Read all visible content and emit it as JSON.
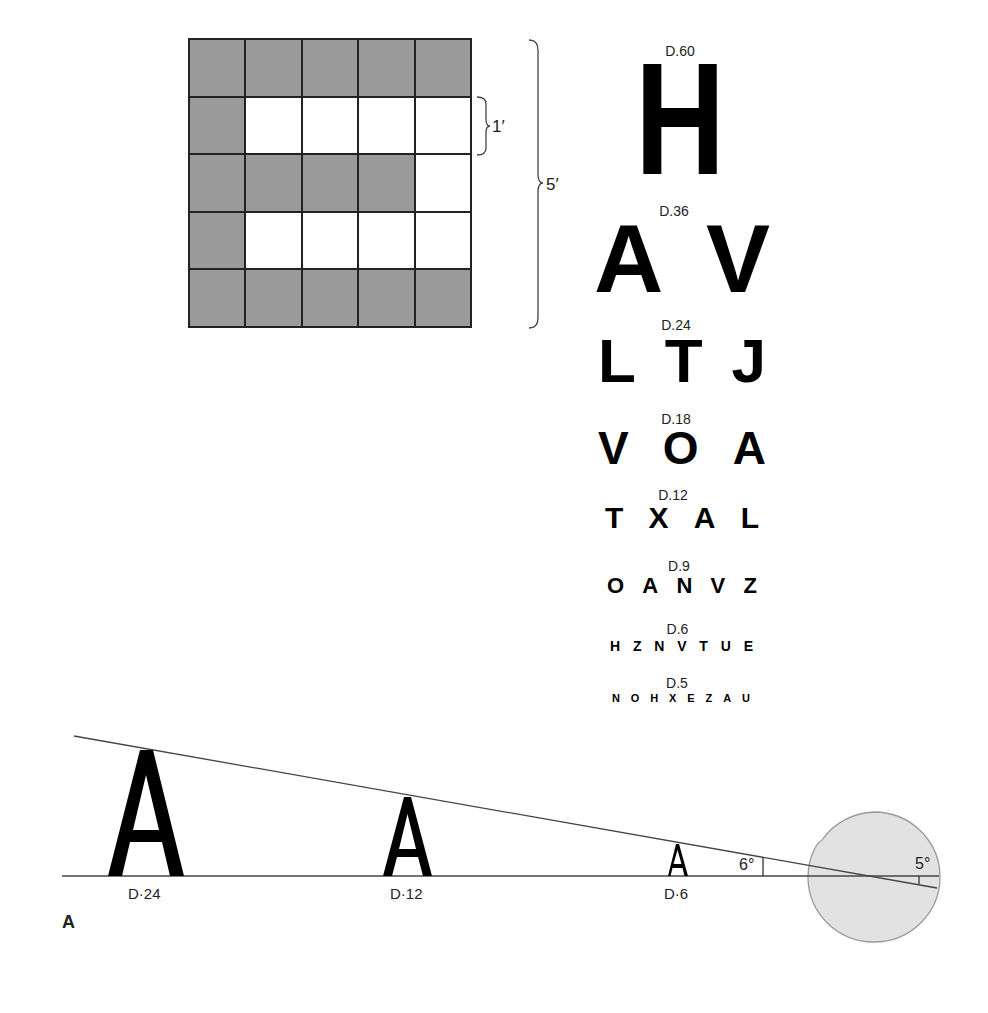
{
  "grid": {
    "rows": [
      [
        1,
        1,
        1,
        1,
        1
      ],
      [
        1,
        0,
        0,
        0,
        0
      ],
      [
        1,
        1,
        1,
        1,
        0
      ],
      [
        1,
        0,
        0,
        0,
        0
      ],
      [
        1,
        1,
        1,
        1,
        1
      ]
    ],
    "fill_color": "#9a9a9a",
    "unit_label": "1′",
    "total_label": "5′"
  },
  "snellen_chart": {
    "rows": [
      {
        "label": "D.60",
        "letters": [
          "H"
        ]
      },
      {
        "label": "D.36",
        "letters": [
          "A",
          "V"
        ]
      },
      {
        "label": "D.24",
        "letters": [
          "L",
          "T",
          "J"
        ]
      },
      {
        "label": "D.18",
        "letters": [
          "V",
          "O",
          "A"
        ]
      },
      {
        "label": "D.12",
        "letters": [
          "T",
          "X",
          "A",
          "L"
        ]
      },
      {
        "label": "D.9",
        "letters": [
          "O",
          "A",
          "N",
          "V",
          "Z"
        ]
      },
      {
        "label": "D.6",
        "letters": [
          "H",
          "Z",
          "N",
          "V",
          "T",
          "U",
          "E"
        ]
      },
      {
        "label": "D.5",
        "letters": [
          "N",
          "O",
          "H",
          "X",
          "E",
          "Z",
          "A",
          "U"
        ]
      }
    ]
  },
  "visual_angle": {
    "letters": [
      {
        "glyph": "A",
        "label": "D·24"
      },
      {
        "glyph": "A",
        "label": "D·12"
      },
      {
        "glyph": "A",
        "label": "D·6"
      }
    ],
    "angle_outside": "6°",
    "angle_inside": "5°",
    "eye_color": "#e2e2e2"
  },
  "panel_label": "A"
}
